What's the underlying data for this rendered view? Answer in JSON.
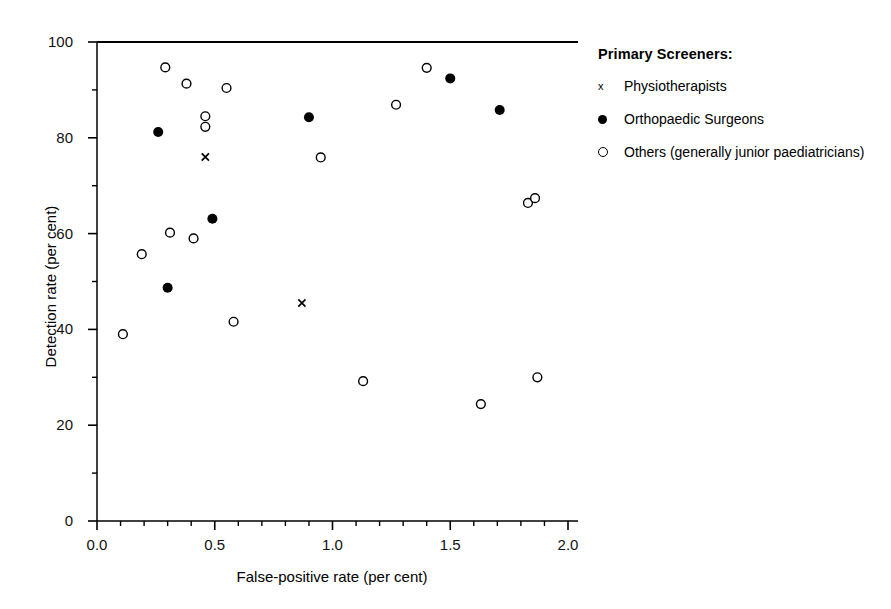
{
  "chart_data": {
    "type": "scatter",
    "title": "",
    "xlabel": "False-positive rate (per cent)",
    "ylabel": "Detection rate (per cent)",
    "xlim": [
      0.0,
      2.0
    ],
    "ylim": [
      0,
      100
    ],
    "xticks": [
      "0.0",
      "0.5",
      "1.0",
      "1.5",
      "2.0"
    ],
    "xtick_values": [
      0.0,
      0.5,
      1.0,
      1.5,
      2.0
    ],
    "yticks": [
      "0",
      "20",
      "40",
      "60",
      "80",
      "100"
    ],
    "ytick_values": [
      0,
      20,
      40,
      60,
      80,
      100
    ],
    "x_minor_step": 0.1,
    "y_minor_step": 10,
    "grid": false,
    "legend_position": "right",
    "legend_title": "Primary Screeners:",
    "series": [
      {
        "name": "Physiotherapists",
        "marker": "x",
        "color": "#000000",
        "points": [
          {
            "x": 0.46,
            "y": 76.0
          },
          {
            "x": 0.87,
            "y": 45.5
          }
        ]
      },
      {
        "name": "Orthopaedic Surgeons",
        "marker": "filled-circle",
        "color": "#000000",
        "points": [
          {
            "x": 0.26,
            "y": 81.2
          },
          {
            "x": 0.3,
            "y": 48.7
          },
          {
            "x": 0.49,
            "y": 63.1
          },
          {
            "x": 0.9,
            "y": 84.3
          },
          {
            "x": 1.5,
            "y": 92.4
          },
          {
            "x": 1.71,
            "y": 85.8
          }
        ]
      },
      {
        "name": "Others (generally junior paediatricians)",
        "marker": "open-circle",
        "color": "#000000",
        "points": [
          {
            "x": 0.11,
            "y": 39.0
          },
          {
            "x": 0.19,
            "y": 55.7
          },
          {
            "x": 0.29,
            "y": 94.7
          },
          {
            "x": 0.31,
            "y": 60.2
          },
          {
            "x": 0.38,
            "y": 91.3
          },
          {
            "x": 0.41,
            "y": 59.0
          },
          {
            "x": 0.46,
            "y": 84.5
          },
          {
            "x": 0.46,
            "y": 82.3
          },
          {
            "x": 0.55,
            "y": 90.4
          },
          {
            "x": 0.58,
            "y": 41.6
          },
          {
            "x": 0.95,
            "y": 75.9
          },
          {
            "x": 1.13,
            "y": 29.2
          },
          {
            "x": 1.27,
            "y": 86.9
          },
          {
            "x": 1.4,
            "y": 94.6
          },
          {
            "x": 1.63,
            "y": 24.4
          },
          {
            "x": 1.83,
            "y": 66.4
          },
          {
            "x": 1.86,
            "y": 67.4
          },
          {
            "x": 1.87,
            "y": 30.0
          }
        ]
      }
    ]
  },
  "legend": {
    "title": "Primary Screeners:",
    "entries": [
      {
        "symbol": "x-marker-icon",
        "glyph": "x",
        "label": "Physiotherapists"
      },
      {
        "symbol": "filled-circle-icon",
        "glyph": "●",
        "label": "Orthopaedic Surgeons"
      },
      {
        "symbol": "open-circle-icon",
        "glyph": "○",
        "label": "Others (generally junior paediatricians)"
      }
    ]
  }
}
